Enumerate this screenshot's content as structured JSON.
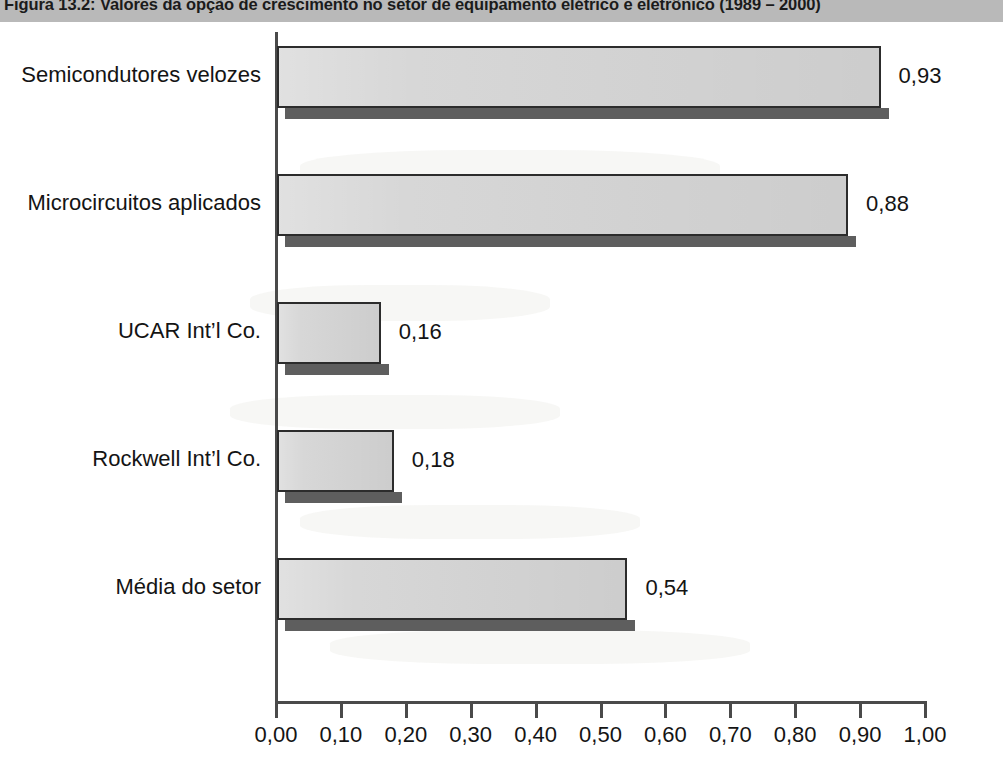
{
  "figure": {
    "title": "Figura 13.2: Valores da opção de crescimento no setor de equipamento elétrico e eletrônico (1989 – 2000)"
  },
  "chart_data": {
    "type": "bar",
    "orientation": "horizontal",
    "title": "Figura 13.2: Valores da opção de crescimento no setor de equipamento elétrico e eletrônico (1989 – 2000)",
    "xlabel": "",
    "ylabel": "",
    "xlim": [
      0,
      1
    ],
    "grid": false,
    "legend": null,
    "categories": [
      "Semicondutores velozes",
      "Microcircuitos aplicados",
      "UCAR Int’l Co.",
      "Rockwell Int’l Co.",
      "Média do setor"
    ],
    "values": [
      0.93,
      0.88,
      0.16,
      0.18,
      0.54
    ],
    "value_labels": [
      "0,93",
      "0,88",
      "0,16",
      "0,18",
      "0,54"
    ],
    "xticks": [
      0,
      0.1,
      0.2,
      0.3,
      0.4,
      0.5,
      0.6,
      0.7,
      0.8,
      0.9,
      1.0
    ],
    "xtick_labels": [
      "0,00",
      "0,10",
      "0,20",
      "0,30",
      "0,40",
      "0,50",
      "0,60",
      "0,70",
      "0,80",
      "0,90",
      "1,00"
    ],
    "colors": {
      "bar_fill": "#d5d5d5",
      "bar_border": "#2c2c2c",
      "bar_shadow": "#5e5e5e",
      "axis": "#4a4a4a",
      "text": "#141414",
      "title_band": "#b9b9b9"
    }
  }
}
